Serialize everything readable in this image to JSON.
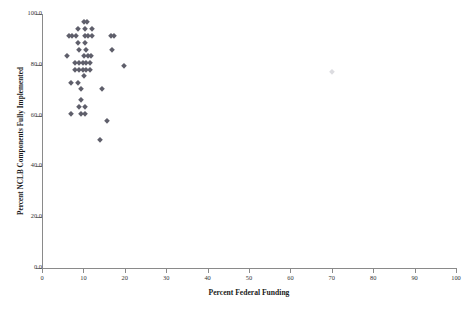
{
  "chart_data": {
    "type": "scatter",
    "title": "",
    "xlabel": "Percent Federal Funding",
    "ylabel": "Percent NCLB Components Fully Implemented",
    "xlim": [
      0,
      100
    ],
    "ylim": [
      0,
      100
    ],
    "xticks": [
      "0",
      "10",
      "20",
      "30",
      "40",
      "50",
      "60",
      "70",
      "80",
      "90",
      "100"
    ],
    "xtick_values": [
      0,
      10,
      20,
      30,
      40,
      50,
      60,
      70,
      80,
      90,
      100
    ],
    "yticks": [
      "0.0",
      "20.0",
      "40.0",
      "60.0",
      "80.0",
      "100.0"
    ],
    "ytick_values": [
      0,
      20,
      40,
      60,
      80,
      100
    ],
    "grid": false,
    "legend": null,
    "marker_shape": "diamond",
    "marker_color": "#5f5f6b",
    "points": [
      [
        10.1,
        96.8
      ],
      [
        10.9,
        96.8
      ],
      [
        8.7,
        94.0
      ],
      [
        10.4,
        94.0
      ],
      [
        12.1,
        94.0
      ],
      [
        6.5,
        91.3
      ],
      [
        7.3,
        91.3
      ],
      [
        8.2,
        91.3
      ],
      [
        10.4,
        91.3
      ],
      [
        11.2,
        91.3
      ],
      [
        12.0,
        91.3
      ],
      [
        16.6,
        91.3
      ],
      [
        17.4,
        91.3
      ],
      [
        8.7,
        88.6
      ],
      [
        10.4,
        88.6
      ],
      [
        9.0,
        86.0
      ],
      [
        10.6,
        86.0
      ],
      [
        17.0,
        86.0
      ],
      [
        6.0,
        83.4
      ],
      [
        10.1,
        83.4
      ],
      [
        11.0,
        83.4
      ],
      [
        11.9,
        83.4
      ],
      [
        8.0,
        80.7
      ],
      [
        8.9,
        80.7
      ],
      [
        9.8,
        80.7
      ],
      [
        10.7,
        80.7
      ],
      [
        11.6,
        80.7
      ],
      [
        8.0,
        78.0
      ],
      [
        8.9,
        78.0
      ],
      [
        9.8,
        78.0
      ],
      [
        10.7,
        78.0
      ],
      [
        11.6,
        78.0
      ],
      [
        19.8,
        79.5
      ],
      [
        10.2,
        75.5
      ],
      [
        7.0,
        73.0
      ],
      [
        8.6,
        73.0
      ],
      [
        9.4,
        70.5
      ],
      [
        14.6,
        70.3
      ],
      [
        9.4,
        66.0
      ],
      [
        9.0,
        63.5
      ],
      [
        10.4,
        63.5
      ],
      [
        7.0,
        60.5
      ],
      [
        9.4,
        60.5
      ],
      [
        10.3,
        60.5
      ],
      [
        15.6,
        58.0
      ],
      [
        14.0,
        50.5
      ],
      [
        70.0,
        77.0
      ]
    ]
  }
}
